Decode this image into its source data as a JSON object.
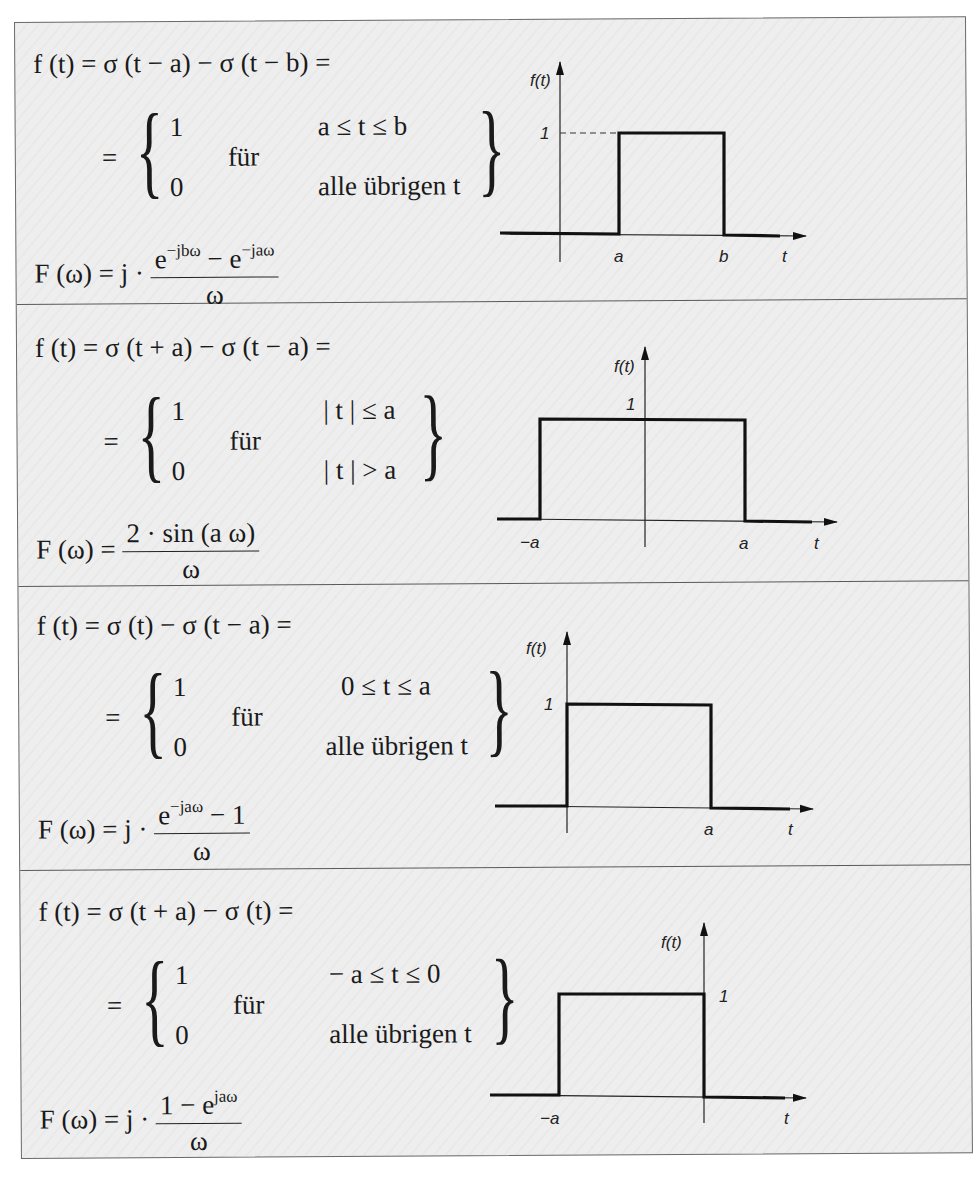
{
  "rows": [
    {
      "line1": "f (t) = σ (t − a) − σ (t − b) =",
      "eq": "=",
      "value_one": "1",
      "value_zero": "0",
      "fuer": "für",
      "cond_one": "a ≤ t ≤ b",
      "cond_zero": "alle übrigen t",
      "transform_lhs": "F (ω) = j ·",
      "transform_num_base": "e",
      "transform_num_sup1": "−jbω",
      "transform_num_mid": " − e",
      "transform_num_sup2": "−jaω",
      "transform_num_tail": "",
      "transform_den": "ω",
      "graph": {
        "ylabel": "f(t)",
        "xlabel": "t",
        "one_label": "1",
        "tick_labels": [
          "a",
          "b"
        ]
      }
    },
    {
      "line1": "f (t) = σ (t + a) − σ (t − a) =",
      "eq": "=",
      "value_one": "1",
      "value_zero": "0",
      "fuer": "für",
      "cond_one": "| t | ≤ a",
      "cond_zero": "| t | > a",
      "transform_lhs": "F (ω) =",
      "transform_num_base": "2 · sin (a ω)",
      "transform_num_sup1": "",
      "transform_num_mid": "",
      "transform_num_sup2": "",
      "transform_num_tail": "",
      "transform_den": "ω",
      "graph": {
        "ylabel": "f(t)",
        "xlabel": "t",
        "one_label": "1",
        "tick_labels": [
          "−a",
          "a"
        ]
      }
    },
    {
      "line1": "f (t) = σ (t) − σ (t − a) =",
      "eq": "=",
      "value_one": "1",
      "value_zero": "0",
      "fuer": "für",
      "cond_one": "0 ≤ t ≤ a",
      "cond_zero": "alle übrigen t",
      "transform_lhs": "F (ω) = j ·",
      "transform_num_base": "e",
      "transform_num_sup1": "−jaω",
      "transform_num_mid": " − 1",
      "transform_num_sup2": "",
      "transform_num_tail": "",
      "transform_den": "ω",
      "graph": {
        "ylabel": "f(t)",
        "xlabel": "t",
        "one_label": "1",
        "tick_labels": [
          "a"
        ]
      }
    },
    {
      "line1": "f (t) = σ (t + a) − σ (t) =",
      "eq": "=",
      "value_one": "1",
      "value_zero": "0",
      "fuer": "für",
      "cond_one": "− a ≤ t ≤ 0",
      "cond_zero": "alle übrigen t",
      "transform_lhs": "F (ω) = j ·",
      "transform_num_base": "1 − e",
      "transform_num_sup1": "jaω",
      "transform_num_mid": "",
      "transform_num_sup2": "",
      "transform_num_tail": "",
      "transform_den": "ω",
      "graph": {
        "ylabel": "f(t)",
        "xlabel": "t",
        "one_label": "1",
        "tick_labels": [
          "−a"
        ]
      }
    }
  ]
}
